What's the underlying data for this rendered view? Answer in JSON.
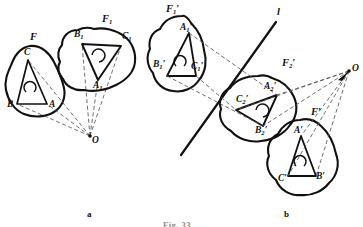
{
  "figure": {
    "caption": "Fig. 33",
    "panel_a_label": "a",
    "panel_b_label": "b",
    "stroke_color": "#111111",
    "dash_color": "#555555"
  },
  "panel_a": {
    "shapes": [
      {
        "name": "F",
        "label": "F"
      },
      {
        "name": "F1",
        "label": "F",
        "sub": "1"
      }
    ],
    "points": [
      {
        "name": "A",
        "label": "A",
        "x": 49,
        "y": 106
      },
      {
        "name": "B",
        "label": "B",
        "x": 9,
        "y": 106
      },
      {
        "name": "C",
        "label": "C",
        "x": 27,
        "y": 52
      },
      {
        "name": "A1",
        "label": "A",
        "sub": "1",
        "x": 96,
        "y": 87
      },
      {
        "name": "B1",
        "label": "B",
        "sub": "1",
        "x": 77,
        "y": 34
      },
      {
        "name": "C1",
        "label": "C",
        "sub": "1",
        "x": 127,
        "y": 36
      },
      {
        "name": "O",
        "label": "O",
        "x": 93,
        "y": 138
      }
    ],
    "shape_labels": [
      {
        "name": "F-label",
        "text": "F",
        "x": 30,
        "y": 38
      },
      {
        "name": "F1-label",
        "text": "F",
        "sub": "1",
        "x": 102,
        "y": 20
      }
    ]
  },
  "panel_b": {
    "shapes": [
      {
        "name": "F1p",
        "label": "F",
        "sub": "1",
        "prime": true
      },
      {
        "name": "F2p",
        "label": "F",
        "sub": "2",
        "prime": true
      },
      {
        "name": "Fp",
        "label": "F",
        "prime": true
      }
    ],
    "points": [
      {
        "name": "A1p",
        "label": "A",
        "sub": "1",
        "prime": true,
        "x": 184,
        "y": 28
      },
      {
        "name": "B1p",
        "label": "B",
        "sub": "1",
        "prime": true,
        "x": 157,
        "y": 65
      },
      {
        "name": "C1p",
        "label": "C",
        "sub": "1",
        "prime": true,
        "x": 195,
        "y": 68
      },
      {
        "name": "A2p",
        "label": "A",
        "sub": "2",
        "prime": true,
        "x": 268,
        "y": 87
      },
      {
        "name": "B2p",
        "label": "B",
        "sub": "2",
        "prime": true,
        "x": 259,
        "y": 128
      },
      {
        "name": "C2p",
        "label": "C",
        "sub": "2",
        "prime": true,
        "x": 242,
        "y": 101
      },
      {
        "name": "Ap",
        "label": "A",
        "prime": true,
        "x": 296,
        "y": 132
      },
      {
        "name": "Bp",
        "label": "B",
        "prime": true,
        "x": 318,
        "y": 178
      },
      {
        "name": "Cp",
        "label": "C",
        "prime": true,
        "x": 281,
        "y": 180
      },
      {
        "name": "O",
        "label": "O",
        "x": 352,
        "y": 69
      }
    ],
    "shape_labels": [
      {
        "name": "F1p-label",
        "text": "F",
        "sub": "1",
        "prime": true,
        "x": 166,
        "y": 8
      },
      {
        "name": "F2p-label",
        "text": "F",
        "sub": "2",
        "prime": true,
        "x": 282,
        "y": 63
      },
      {
        "name": "Fp-label",
        "text": "F",
        "prime": true,
        "x": 312,
        "y": 113
      }
    ],
    "line": {
      "name": "axis-line-l",
      "label": "l",
      "x": 277,
      "y": 12
    }
  }
}
